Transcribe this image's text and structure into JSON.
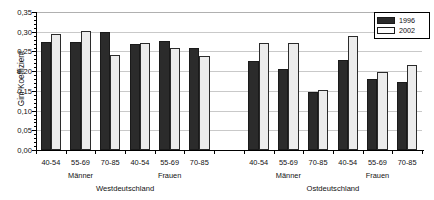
{
  "chart_data": {
    "type": "bar",
    "title": "",
    "subtitle": "",
    "xlabel": "",
    "ylabel": "Gini-Koeffizient",
    "ylim": [
      0.0,
      0.35
    ],
    "ytick_labels": [
      "0,35",
      "0,30",
      "0,25",
      "0,20",
      "0,15",
      "0,10",
      "0,05",
      "0,00"
    ],
    "ytick_values": [
      0.35,
      0.3,
      0.25,
      0.2,
      0.15,
      0.1,
      0.05,
      0.0
    ],
    "ytick_step": 0.05,
    "grid": true,
    "grid_axis": "y",
    "legend_position": "top-right",
    "categories": [
      "40-54",
      "55-69",
      "70-85",
      "40-54",
      "55-69",
      "70-85",
      "40-54",
      "55-69",
      "70-85",
      "40-54",
      "55-69",
      "70-85"
    ],
    "group_labels": [
      "Männer",
      "Frauen",
      "Männer",
      "Frauen"
    ],
    "region_labels": [
      "Westdeutschland",
      "Ostdeutschland"
    ],
    "series": [
      {
        "name": "1996",
        "color": "#2b2b2b",
        "values": [
          0.275,
          0.273,
          0.3,
          0.27,
          0.276,
          0.258,
          0.225,
          0.205,
          0.148,
          0.228,
          0.18,
          0.172
        ]
      },
      {
        "name": "2002",
        "color": "#ececec",
        "values": [
          0.293,
          0.302,
          0.241,
          0.272,
          0.259,
          0.239,
          0.272,
          0.272,
          0.151,
          0.29,
          0.199,
          0.215
        ]
      }
    ]
  },
  "axis": {
    "y_title": "Gini-Koeffizient"
  },
  "legend": {
    "items": [
      {
        "label": "1996",
        "swatch": "dark-filled-swatch"
      },
      {
        "label": "2002",
        "swatch": "light-outlined-swatch"
      }
    ]
  },
  "xaxis": {
    "categories": [
      {
        "label": "40-54"
      },
      {
        "label": "55-69"
      },
      {
        "label": "70-85"
      },
      {
        "label": "40-54"
      },
      {
        "label": "55-69"
      },
      {
        "label": "70-85"
      },
      {
        "label": "40-54"
      },
      {
        "label": "55-69"
      },
      {
        "label": "70-85"
      },
      {
        "label": "40-54"
      },
      {
        "label": "55-69"
      },
      {
        "label": "70-85"
      }
    ],
    "sexgroups": [
      {
        "label": "Männer"
      },
      {
        "label": "Frauen"
      },
      {
        "label": "Männer"
      },
      {
        "label": "Frauen"
      }
    ],
    "regions": [
      {
        "label": "Westdeutschland"
      },
      {
        "label": "Ostdeutschland"
      }
    ]
  }
}
